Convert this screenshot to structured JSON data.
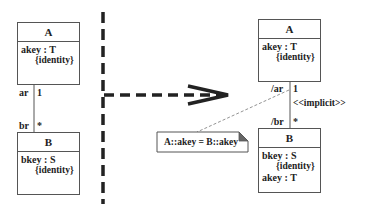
{
  "left": {
    "classA": {
      "name": "A",
      "attribute": "akey : T",
      "constraint": "{identity}"
    },
    "classB": {
      "name": "B",
      "attribute": "bkey : S",
      "constraint": "{identity}"
    },
    "association": {
      "roleA": "ar",
      "multA": "1",
      "roleB": "br",
      "multB": "*"
    }
  },
  "right": {
    "classA": {
      "name": "A",
      "attribute": "akey : T",
      "constraint": "{identity}"
    },
    "classB": {
      "name": "B",
      "attribute": "bkey : S",
      "constraint": "{identity}",
      "derived_attribute": "akey : T"
    },
    "association": {
      "roleA": "/ar",
      "multA": "1",
      "roleB": "/br",
      "multB": "*",
      "stereotype": "<<implicit>>"
    },
    "note": {
      "text": "A::akey = B::akey"
    }
  },
  "transformation_arrow": {
    "style": "dashed",
    "direction": "left-to-right"
  },
  "colors": {
    "line": "#555555",
    "dark": "#222222",
    "note_fold": "#666666"
  }
}
